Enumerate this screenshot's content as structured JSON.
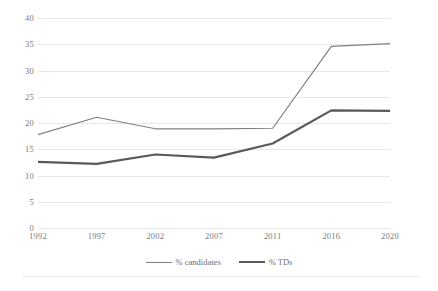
{
  "chart_data": {
    "type": "line",
    "title": "",
    "subtitle": "",
    "xlabel": "",
    "ylabel": "",
    "categories": [
      "1992",
      "1997",
      "2002",
      "2007",
      "2011",
      "2016",
      "2020"
    ],
    "series": [
      {
        "name": "% candidates",
        "color": "#808080",
        "line_width": 1.2,
        "values": [
          17.8,
          21.1,
          18.9,
          18.9,
          19.0,
          34.6,
          35.1
        ]
      },
      {
        "name": "% TDs",
        "color": "#595959",
        "line_width": 2.2,
        "values": [
          12.6,
          12.2,
          14.0,
          13.4,
          16.1,
          22.4,
          22.3
        ]
      }
    ],
    "ylim": [
      0,
      40
    ],
    "yticks": [
      0,
      5,
      10,
      15,
      20,
      25,
      30,
      35,
      40
    ],
    "ytick_labels": [
      "0",
      "5",
      "10",
      "15",
      "20",
      "25",
      "30",
      "35",
      "40"
    ],
    "grid": true,
    "grid_axis": "y",
    "grid_color": "#e8e8e8",
    "legend_position": "bottom",
    "legend": [
      "% candidates",
      "% TDs"
    ],
    "background": "#ffffff",
    "tick_label_color": "#7a7a7a"
  }
}
